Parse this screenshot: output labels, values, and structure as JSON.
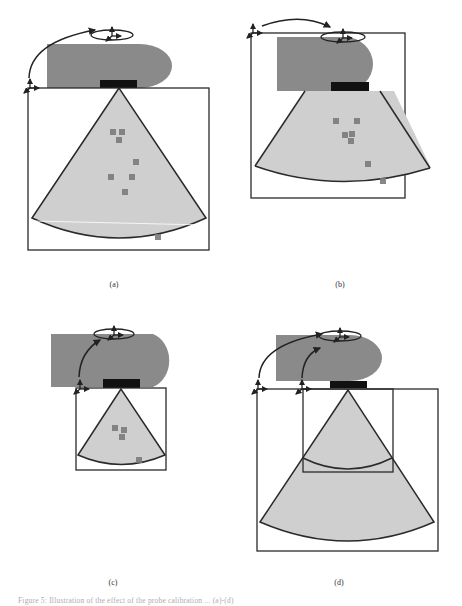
{
  "figure": {
    "panels": [
      {
        "id": "a",
        "label": "(a)"
      },
      {
        "id": "b",
        "label": "(b)"
      },
      {
        "id": "c",
        "label": "(c)"
      },
      {
        "id": "d",
        "label": "(d)"
      }
    ],
    "caption": "Figure 5: Illustration of the effect of the probe calibration ... (a)-(d)"
  },
  "colors": {
    "probe_body": "#8a8a8a",
    "transducer": "#111111",
    "fan": "#cfcfcf",
    "outline": "#2a2a2a",
    "marker": "#7a7a7a"
  }
}
